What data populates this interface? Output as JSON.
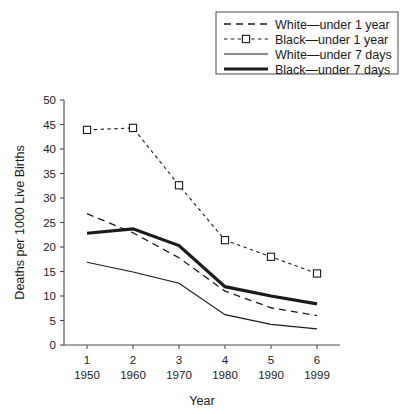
{
  "chart_data": {
    "type": "line",
    "title": "",
    "xlabel": "Year",
    "ylabel": "Deaths per 1000 Live Births",
    "x": [
      1,
      2,
      3,
      4,
      5,
      6
    ],
    "xtick_labels_top": [
      "1",
      "2",
      "3",
      "4",
      "5",
      "6"
    ],
    "xtick_labels_bottom": [
      "1950",
      "1960",
      "1970",
      "1980",
      "1990",
      "1999"
    ],
    "ytick_labels": [
      "0",
      "5",
      "10",
      "15",
      "20",
      "25",
      "30",
      "35",
      "40",
      "45",
      "50"
    ],
    "ylim": [
      0,
      50
    ],
    "xlim": [
      0.5,
      6.5
    ],
    "grid": false,
    "legend_position": "top-right-outside",
    "series": [
      {
        "name": "White—under 1 year",
        "style": "dashed-long",
        "marker": "none",
        "values": [
          26.8,
          22.9,
          17.8,
          11.0,
          7.6,
          6.0
        ]
      },
      {
        "name": "Black—under 1 year",
        "style": "dashed-short",
        "marker": "open-square",
        "values": [
          43.9,
          44.3,
          32.6,
          21.4,
          18.0,
          14.6
        ]
      },
      {
        "name": "White—under 7 days",
        "style": "solid-thin",
        "marker": "none",
        "values": [
          16.9,
          14.9,
          12.6,
          6.2,
          4.2,
          3.3
        ]
      },
      {
        "name": "Black—under 7 days",
        "style": "solid-thick",
        "marker": "none",
        "values": [
          22.8,
          23.7,
          20.3,
          11.9,
          10.0,
          8.4
        ]
      }
    ]
  },
  "legend": {
    "entries": [
      {
        "label": "White—under 1 year"
      },
      {
        "label": "Black—under 1 year"
      },
      {
        "label": "White—under 7 days"
      },
      {
        "label": "Black—under 7 days"
      }
    ]
  },
  "colors": {
    "line": "#1a1a1a",
    "axis": "#4a4a4a",
    "background": "#ffffff"
  }
}
